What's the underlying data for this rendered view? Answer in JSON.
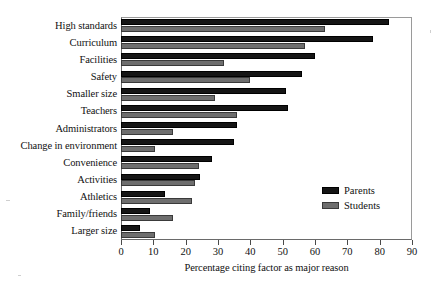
{
  "chart_data": {
    "type": "bar",
    "orientation": "horizontal",
    "title": "",
    "xlabel": "Percentage citing factor as major reason",
    "ylabel": "",
    "xlim": [
      0,
      90
    ],
    "xticks": [
      0,
      10,
      20,
      30,
      40,
      50,
      60,
      70,
      80,
      90
    ],
    "grid": false,
    "legend_position": "inside-lower-right",
    "categories": [
      "High standards",
      "Curriculum",
      "Facilities",
      "Safety",
      "Smaller size",
      "Teachers",
      "Administrators",
      "Change in  environment",
      "Convenience",
      "Activities",
      "Athletics",
      "Family/friends",
      "Larger size"
    ],
    "series": [
      {
        "name": "Parents",
        "color": "#151515",
        "values": [
          83,
          78,
          60,
          56,
          51,
          51.5,
          36,
          35,
          28,
          24.5,
          13.5,
          9,
          6
        ]
      },
      {
        "name": "Students",
        "color": "#6e6e6e",
        "values": [
          63,
          57,
          32,
          40,
          29,
          36,
          16,
          10.5,
          24,
          23,
          22,
          16,
          10.5
        ]
      }
    ]
  },
  "legend": {
    "items": [
      {
        "label": "Parents",
        "color": "#151515"
      },
      {
        "label": "Students",
        "color": "#6e6e6e"
      }
    ]
  }
}
